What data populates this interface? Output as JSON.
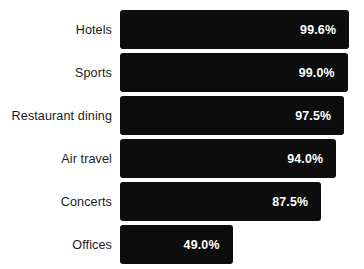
{
  "chart_data": {
    "type": "bar",
    "orientation": "horizontal",
    "title": "",
    "subtitle": "",
    "xlabel": "",
    "ylabel": "",
    "xlim": [
      0,
      100
    ],
    "grid": false,
    "legend": null,
    "value_suffix": "%",
    "categories": [
      "Hotels",
      "Sports",
      "Restaurant dining",
      "Air travel",
      "Concerts",
      "Offices"
    ],
    "values": [
      99.6,
      99.0,
      97.5,
      94.0,
      87.5,
      49.0
    ],
    "value_labels": [
      "99.6%",
      "99.0%",
      "97.5%",
      "94.0%",
      "87.5%",
      "49.0%"
    ],
    "bar_color": "#0d0d0d",
    "value_label_color": "#ffffff",
    "category_label_color": "#1b1b1b",
    "background_color": "#ffffff",
    "rows": [
      {
        "category": "Hotels",
        "value": 99.6,
        "value_label": "99.6%"
      },
      {
        "category": "Sports",
        "value": 99.0,
        "value_label": "99.0%"
      },
      {
        "category": "Restaurant dining",
        "value": 97.5,
        "value_label": "97.5%"
      },
      {
        "category": "Air travel",
        "value": 94.0,
        "value_label": "94.0%"
      },
      {
        "category": "Concerts",
        "value": 87.5,
        "value_label": "87.5%"
      },
      {
        "category": "Offices",
        "value": 49.0,
        "value_label": "49.0%"
      }
    ]
  }
}
